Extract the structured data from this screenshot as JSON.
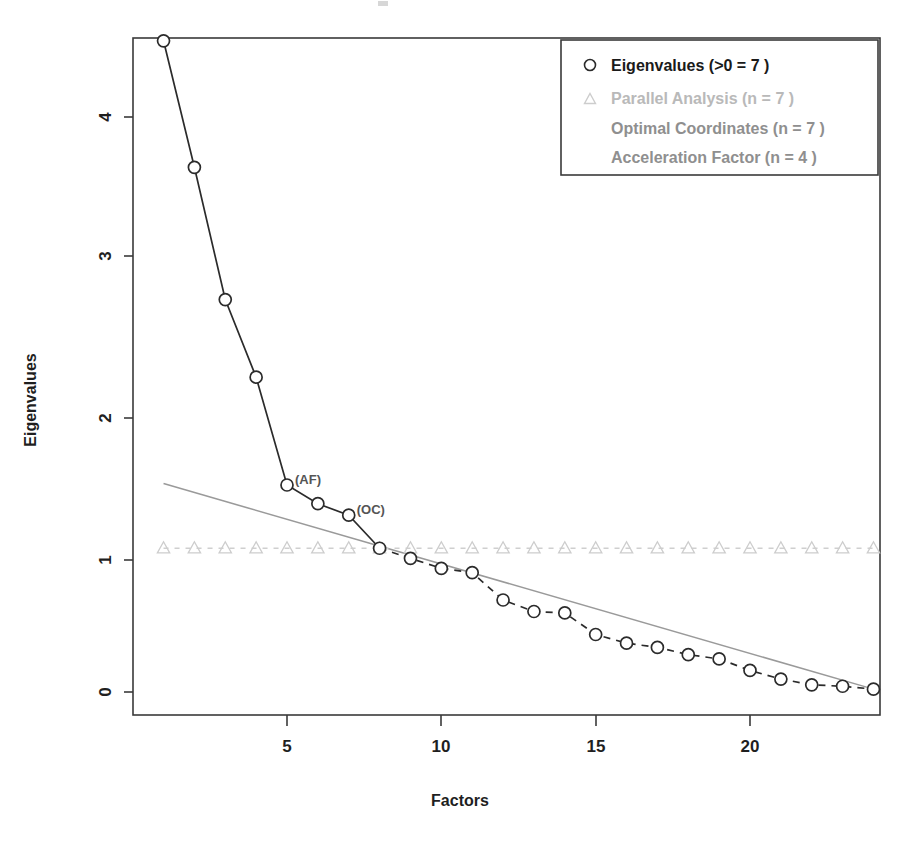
{
  "chart_data": {
    "type": "line",
    "title": "",
    "xlabel": "Factors",
    "ylabel": "Eigenvalues",
    "xlim": [
      1,
      24
    ],
    "ylim": [
      -0.05,
      4.7
    ],
    "xticks": [
      5,
      10,
      15,
      20
    ],
    "yticks": [
      0,
      1,
      2,
      3,
      4
    ],
    "grid": false,
    "legend_position": "top-right",
    "x": [
      1,
      2,
      3,
      4,
      5,
      6,
      7,
      8,
      9,
      10,
      11,
      12,
      13,
      14,
      15,
      16,
      17,
      18,
      19,
      20,
      21,
      22,
      23,
      24
    ],
    "series": [
      {
        "name": "Eigenvalues (>0 =  7 )",
        "marker": "circle",
        "color": "#2b2b2b",
        "values": [
          4.53,
          3.65,
          2.73,
          2.19,
          1.44,
          1.31,
          1.23,
          1.0,
          0.93,
          0.86,
          0.83,
          0.64,
          0.56,
          0.55,
          0.4,
          0.34,
          0.31,
          0.26,
          0.23,
          0.15,
          0.09,
          0.05,
          0.04,
          0.02
        ]
      },
      {
        "name": "Parallel Analysis (n =  7 )",
        "marker": "triangle",
        "color": "#cdcdcd",
        "values": [
          1.0,
          1.0,
          1.0,
          1.0,
          1.0,
          1.0,
          1.0,
          1.0,
          1.0,
          1.0,
          1.0,
          1.0,
          1.0,
          1.0,
          1.0,
          1.0,
          1.0,
          1.0,
          1.0,
          1.0,
          1.0,
          1.0,
          1.0,
          1.0
        ]
      },
      {
        "name": "Optimal Coordinates (n =  7 )",
        "marker": "none",
        "color": "#9a9a9a",
        "line_from": [
          1,
          1.45
        ],
        "line_to": [
          24,
          0.02
        ]
      },
      {
        "name": "Acceleration Factor (n =  4 )",
        "marker": "none",
        "color": "#8f8f8f"
      }
    ],
    "annotations": [
      {
        "text": "(AF)",
        "x": 5,
        "y": 1.44
      },
      {
        "text": "(OC)",
        "x": 7,
        "y": 1.23
      }
    ]
  },
  "axes": {
    "y_label": "Eigenvalues",
    "x_label": "Factors",
    "y_tick_labels": [
      "0",
      "1",
      "2",
      "3",
      "4"
    ],
    "x_tick_labels": [
      "5",
      "10",
      "15",
      "20"
    ]
  },
  "legend": {
    "entries": [
      {
        "label": "Eigenvalues (>0 =  7 )",
        "marker": "circle-marker",
        "style": "ev"
      },
      {
        "label": "Parallel Analysis (n =  7 )",
        "marker": "triangle-marker",
        "style": "pa"
      },
      {
        "label": "Optimal Coordinates (n =  7 )",
        "marker": "none",
        "style": "oc"
      },
      {
        "label": "Acceleration Factor (n =  4 )",
        "marker": "none",
        "style": "af"
      }
    ]
  },
  "annotations": {
    "af": "(AF)",
    "oc": "(OC)"
  },
  "colors": {
    "eigenvalues": "#2b2b2b",
    "parallel_analysis": "#cdcdcd",
    "optimal_coordinates": "#9a9a9a",
    "acceleration_factor": "#8f8f8f",
    "frame": "#3a3a3a",
    "background": "#ffffff"
  }
}
